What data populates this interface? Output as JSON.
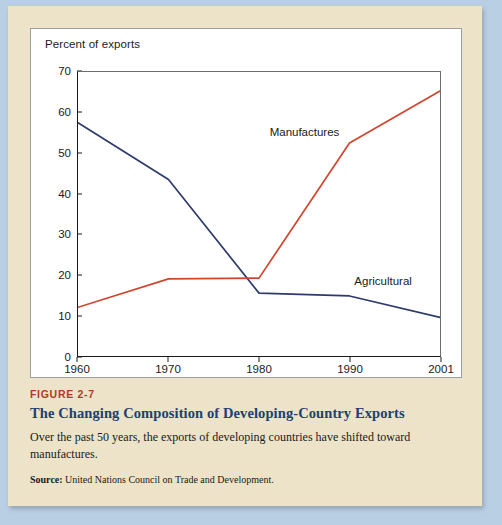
{
  "chart_data": {
    "type": "line",
    "title": "",
    "ylabel": "Percent of exports",
    "xlabel": "",
    "ylim": [
      0,
      70
    ],
    "yticks": [
      0,
      10,
      20,
      30,
      40,
      50,
      60,
      70
    ],
    "grid": false,
    "legend_position": "inline-annotation",
    "x": [
      "1960",
      "1970",
      "1980",
      "1990",
      "2001"
    ],
    "series": [
      {
        "name": "Agricultural",
        "color": "#2d3a6b",
        "values": [
          57.5,
          43.5,
          15.5,
          14.8,
          9.5
        ]
      },
      {
        "name": "Manufactures",
        "color": "#d2442c",
        "values": [
          12.0,
          19.0,
          19.2,
          52.5,
          65.3
        ]
      }
    ],
    "annotations": [
      {
        "text": "Manufactures",
        "x": "1985",
        "y": 55
      },
      {
        "text": "Agricultural",
        "x": "1994",
        "y": 18.5
      }
    ]
  },
  "figure": {
    "number": "FIGURE 2-7",
    "title": "The Changing Composition of Developing-Country Exports",
    "description": "Over the past 50 years, the exports of developing countries have shifted toward manufactures.",
    "source_label": "Source:",
    "source_text": "United Nations Council on Trade and Development."
  },
  "colors": {
    "page_background": "#b9cfe3",
    "card_background": "#ece3c8",
    "plot_background": "#ffffff",
    "agricultural_line": "#2d3a6b",
    "manufactures_line": "#d2442c",
    "figure_number": "#b03a2a",
    "figure_title": "#1c3f75"
  }
}
